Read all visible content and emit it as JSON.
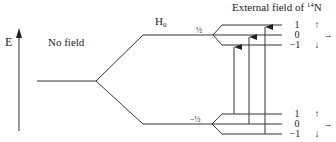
{
  "diagram": {
    "axis_label": "E",
    "no_field_label": "No field",
    "h0_label": "H",
    "h0_subscript": "0",
    "external_field_label": "External field of ",
    "nucleus_mass": "14",
    "nucleus_symbol": "N",
    "upper_level_label": "½",
    "lower_level_label": "−½",
    "upper_sublevels": [
      {
        "m": "1",
        "spin_icon": "↑"
      },
      {
        "m": "0",
        "spin_icon": "→"
      },
      {
        "m": "−1",
        "spin_icon": "↓"
      }
    ],
    "lower_sublevels": [
      {
        "m": "1",
        "spin_icon": "↑"
      },
      {
        "m": "0",
        "spin_icon": "→"
      },
      {
        "m": "−1",
        "spin_icon": "↓"
      }
    ],
    "transitions": [
      {
        "from": "lower 1",
        "to": "upper −1"
      },
      {
        "from": "lower 0",
        "to": "upper 0"
      },
      {
        "from": "lower −1",
        "to": "upper 1"
      }
    ],
    "colors": {
      "line": "#333333",
      "text": "#222222",
      "background": "#ffffff"
    }
  }
}
